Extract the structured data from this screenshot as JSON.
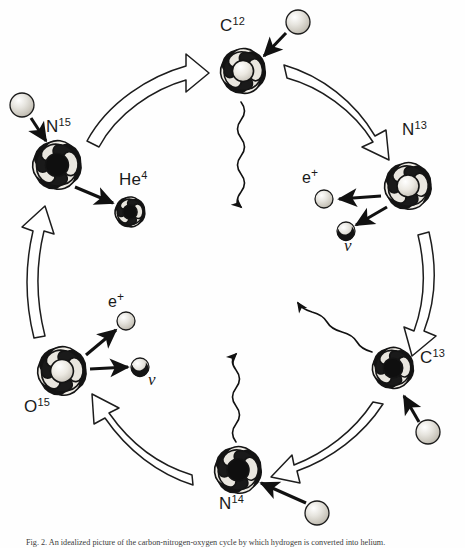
{
  "figure": {
    "caption": "Fig. 2. An idealized picture of the carbon-nitrogen-oxygen cycle by which hydrogen is converted into helium.",
    "background_color": "#fefefe",
    "ink_color": "#111111"
  },
  "nuclei": [
    {
      "id": "c12",
      "element": "C",
      "mass": "12",
      "label_x": 222,
      "label_y": 24,
      "cx": 243,
      "cy": 71,
      "r": 24,
      "style": "medium"
    },
    {
      "id": "n13",
      "element": "N",
      "mass": "13",
      "label_x": 404,
      "label_y": 127,
      "cx": 408,
      "cy": 186,
      "r": 25,
      "style": "medium"
    },
    {
      "id": "c13",
      "element": "C",
      "mass": "13",
      "label_x": 422,
      "label_y": 355,
      "cx": 393,
      "cy": 368,
      "r": 22,
      "style": "dark"
    },
    {
      "id": "n14",
      "element": "N",
      "mass": "14",
      "label_x": 222,
      "label_y": 497,
      "cx": 238,
      "cy": 470,
      "r": 25,
      "style": "dark"
    },
    {
      "id": "o15",
      "element": "O",
      "mass": "15",
      "label_x": 26,
      "label_y": 400,
      "cx": 62,
      "cy": 371,
      "r": 26,
      "style": "light"
    },
    {
      "id": "n15",
      "element": "N",
      "mass": "15",
      "label_x": 48,
      "label_y": 121,
      "cx": 57,
      "cy": 165,
      "r": 26,
      "style": "dark"
    },
    {
      "id": "he4",
      "element": "He",
      "mass": "4",
      "label_x": 122,
      "label_y": 175,
      "cx": 130,
      "cy": 212,
      "r": 16,
      "style": "dark"
    }
  ],
  "particles": [
    {
      "id": "proton-c12",
      "kind": "proton",
      "cx": 298,
      "cy": 22,
      "r": 12
    },
    {
      "id": "proton-n15",
      "kind": "proton",
      "cx": 22,
      "cy": 105,
      "r": 12
    },
    {
      "id": "proton-c13",
      "kind": "proton",
      "cx": 428,
      "cy": 432,
      "r": 12
    },
    {
      "id": "proton-n14",
      "kind": "proton",
      "cx": 317,
      "cy": 513,
      "r": 12
    },
    {
      "id": "positron-n13",
      "kind": "positron",
      "cx": 324,
      "cy": 199,
      "r": 9,
      "label": "e",
      "sup": "+",
      "label_x": 304,
      "label_y": 172
    },
    {
      "id": "neutrino-n13",
      "kind": "neutrino",
      "cx": 346,
      "cy": 231,
      "r": 9,
      "label": "ν",
      "label_x": 347,
      "label_y": 240
    },
    {
      "id": "positron-o15",
      "kind": "positron",
      "cx": 126,
      "cy": 321,
      "r": 9,
      "label": "e",
      "sup": "+",
      "label_x": 110,
      "label_y": 295
    },
    {
      "id": "neutrino-o15",
      "kind": "neutrino",
      "cx": 140,
      "cy": 367,
      "r": 9,
      "label": "ν",
      "label_x": 150,
      "label_y": 375
    }
  ],
  "labels": {
    "c12": "C",
    "c12_mass": "12",
    "n13": "N",
    "n13_mass": "13",
    "c13": "C",
    "c13_mass": "13",
    "n14": "N",
    "n14_mass": "14",
    "o15": "O",
    "o15_mass": "15",
    "n15": "N",
    "n15_mass": "15",
    "he4": "He",
    "he4_mass": "4",
    "positron": "e",
    "positron_sup": "+",
    "neutrino": "ν"
  },
  "cycle_arrows": [
    {
      "id": "n15-to-c12",
      "from": "n15",
      "to": "c12",
      "direction": "clockwise"
    },
    {
      "id": "c12-to-n13",
      "from": "c12",
      "to": "n13",
      "direction": "clockwise"
    },
    {
      "id": "n13-to-c13",
      "from": "n13",
      "to": "c13",
      "direction": "clockwise"
    },
    {
      "id": "c13-to-n14",
      "from": "c13",
      "to": "n14",
      "direction": "clockwise"
    },
    {
      "id": "n14-to-o15",
      "from": "n14",
      "to": "o15",
      "direction": "clockwise"
    },
    {
      "id": "o15-to-n15",
      "from": "o15",
      "to": "n15",
      "direction": "clockwise"
    }
  ],
  "gamma_rays": [
    {
      "id": "gamma-c12",
      "from": "c12",
      "direction": "down"
    },
    {
      "id": "gamma-n14",
      "from": "n14",
      "direction": "up"
    },
    {
      "id": "gamma-c13",
      "from": "c13",
      "direction": "up-left"
    }
  ],
  "proton_arrows": [
    {
      "id": "proton-arrow-c12",
      "to": "c12"
    },
    {
      "id": "proton-arrow-n15",
      "to": "n15"
    },
    {
      "id": "proton-arrow-c13",
      "to": "c13"
    },
    {
      "id": "proton-arrow-n14",
      "to": "n14"
    }
  ],
  "emission_arrows": [
    {
      "id": "emission-he4",
      "from": "n15",
      "to": "he4"
    },
    {
      "id": "emission-e-n13",
      "from": "n13",
      "to": "positron-n13"
    },
    {
      "id": "emission-v-n13",
      "from": "n13",
      "to": "neutrino-n13"
    },
    {
      "id": "emission-e-o15",
      "from": "o15",
      "to": "positron-o15"
    },
    {
      "id": "emission-v-o15",
      "from": "o15",
      "to": "neutrino-o15"
    }
  ]
}
